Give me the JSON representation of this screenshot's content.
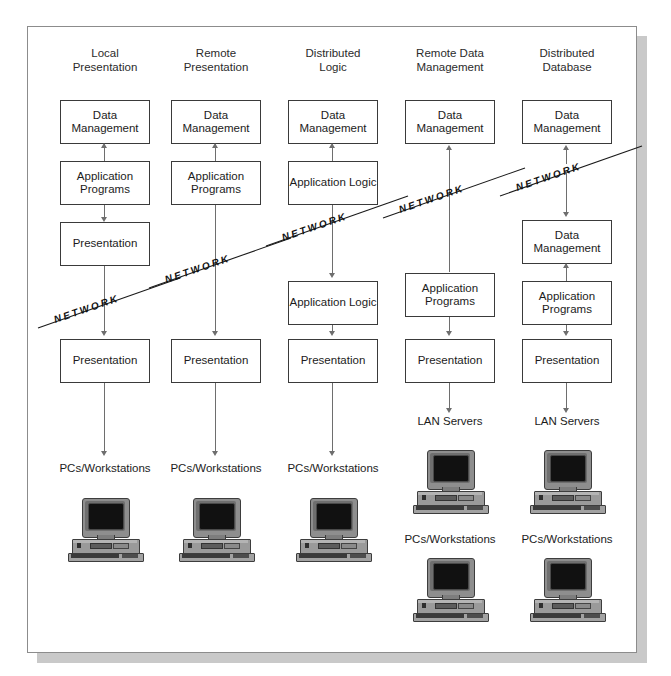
{
  "diagram": {
    "network_label": "NETWORK",
    "columns": [
      {
        "header_line1": "Local",
        "header_line2": "Presentation",
        "nodes": [
          {
            "type": "box",
            "label": "Data\nManagement"
          },
          {
            "type": "box",
            "label": "Application\nPrograms"
          },
          {
            "type": "box",
            "label": "Presentation"
          },
          {
            "type": "network",
            "label": "NETWORK"
          },
          {
            "type": "box",
            "label": "Presentation"
          },
          {
            "type": "text",
            "label": "PCs/Workstations"
          },
          {
            "type": "computer",
            "label": "desktop-computer"
          }
        ]
      },
      {
        "header_line1": "Remote",
        "header_line2": "Presentation",
        "nodes": [
          {
            "type": "box",
            "label": "Data\nManagement"
          },
          {
            "type": "box",
            "label": "Application\nPrograms"
          },
          {
            "type": "network",
            "label": "NETWORK"
          },
          {
            "type": "box",
            "label": "Presentation"
          },
          {
            "type": "text",
            "label": "PCs/Workstations"
          },
          {
            "type": "computer",
            "label": "desktop-computer"
          }
        ]
      },
      {
        "header_line1": "Distributed",
        "header_line2": "Logic",
        "nodes": [
          {
            "type": "box",
            "label": "Data\nManagement"
          },
          {
            "type": "box",
            "label": "Application\nLogic"
          },
          {
            "type": "network",
            "label": "NETWORK"
          },
          {
            "type": "box",
            "label": "Application\nLogic"
          },
          {
            "type": "box",
            "label": "Presentation"
          },
          {
            "type": "text",
            "label": "PCs/Workstations"
          },
          {
            "type": "computer",
            "label": "desktop-computer"
          }
        ]
      },
      {
        "header_line1": "Remote Data",
        "header_line2": "Management",
        "nodes": [
          {
            "type": "box",
            "label": "Data\nManagement"
          },
          {
            "type": "network",
            "label": "NETWORK"
          },
          {
            "type": "box",
            "label": "Application\nPrograms"
          },
          {
            "type": "box",
            "label": "Presentation"
          },
          {
            "type": "text",
            "label": "LAN Servers"
          },
          {
            "type": "computer",
            "label": "desktop-computer"
          },
          {
            "type": "text",
            "label": "PCs/Workstations"
          },
          {
            "type": "computer",
            "label": "desktop-computer"
          }
        ]
      },
      {
        "header_line1": "Distributed",
        "header_line2": "Database",
        "nodes": [
          {
            "type": "box",
            "label": "Data\nManagement"
          },
          {
            "type": "network",
            "label": "NETWORK"
          },
          {
            "type": "box",
            "label": "Data\nManagement"
          },
          {
            "type": "box",
            "label": "Application\nPrograms"
          },
          {
            "type": "box",
            "label": "Presentation"
          },
          {
            "type": "text",
            "label": "LAN Servers"
          },
          {
            "type": "computer",
            "label": "desktop-computer"
          },
          {
            "type": "text",
            "label": "PCs/Workstations"
          },
          {
            "type": "computer",
            "label": "desktop-computer"
          }
        ]
      }
    ],
    "labels": {
      "data_management": "Data Management",
      "application_programs": "Application Programs",
      "application_logic": "Application Logic",
      "presentation": "Presentation",
      "lan_servers": "LAN Servers",
      "pcs_workstations": "PCs/Workstations"
    },
    "colors": {
      "page": "#ffffff",
      "page_border": "#8c8c8c",
      "shadow": "#c9c9c9",
      "box_border": "#3a3a3a",
      "connector": "#6e6e6e",
      "text": "#1c1c1c",
      "header_text": "#2b2b2b"
    }
  }
}
